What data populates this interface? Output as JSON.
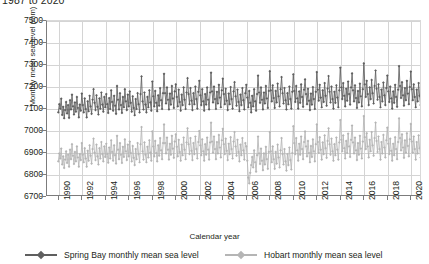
{
  "chart_title": "1987 to 2020",
  "axes": {
    "x_label": "Calendar year",
    "y_label": "Monthly mean sea level (mm)",
    "y_ticks": [
      7500,
      7400,
      7300,
      7200,
      7100,
      7000,
      6900,
      6800,
      6700
    ],
    "x_ticks": [
      1990,
      1992,
      1994,
      1996,
      1998,
      2000,
      2002,
      2004,
      2006,
      2008,
      2010,
      2012,
      2014,
      2016,
      2018,
      2020
    ]
  },
  "legend": {
    "position": "bottom",
    "entries": [
      {
        "label": "Spring Bay monthly mean sea level",
        "color": "#5f5f5f"
      },
      {
        "label": "Hobart monthly mean sea level",
        "color": "#b5b5b5"
      }
    ]
  },
  "chart_data": {
    "type": "line",
    "title": "1987 to 2020",
    "xlabel": "Calendar year",
    "ylabel": "Monthly mean sea level (mm)",
    "xlim": [
      1989.0,
      2020.9
    ],
    "ylim": [
      6700,
      7500
    ],
    "grid": true,
    "x_tick_step": 2,
    "y_tick_step": 100,
    "legend_position": "bottom",
    "marker": "diamond",
    "x_unit": "month",
    "series": [
      {
        "name": "Spring Bay monthly mean sea level",
        "color": "#5f5f5f",
        "x_start": 1989.96,
        "x_step": 0.0833,
        "values": [
          7085,
          7122,
          7101,
          7147,
          7073,
          7110,
          7058,
          7095,
          7132,
          7080,
          7118,
          7060,
          7140,
          7098,
          7165,
          7112,
          7075,
          7130,
          7088,
          7155,
          7105,
          7062,
          7120,
          7092,
          7170,
          7118,
          7085,
          7148,
          7100,
          7062,
          7135,
          7090,
          7160,
          7112,
          7078,
          7142,
          7190,
          7128,
          7095,
          7162,
          7110,
          7075,
          7148,
          7102,
          7175,
          7120,
          7088,
          7155,
          7108,
          7168,
          7122,
          7082,
          7150,
          7100,
          7185,
          7132,
          7092,
          7160,
          7115,
          7078,
          7205,
          7142,
          7098,
          7172,
          7118,
          7082,
          7155,
          7108,
          7190,
          7135,
          7095,
          7165,
          7112,
          7180,
          7128,
          7088,
          7158,
          7105,
          7072,
          7145,
          7100,
          7172,
          7122,
          7085,
          7168,
          7248,
          7135,
          7098,
          7175,
          7120,
          7085,
          7155,
          7108,
          7185,
          7130,
          7092,
          7225,
          7158,
          7112,
          7182,
          7128,
          7090,
          7162,
          7115,
          7195,
          7140,
          7100,
          7172,
          7260,
          7172,
          7125,
          7198,
          7142,
          7098,
          7170,
          7120,
          7205,
          7148,
          7105,
          7180,
          7212,
          7155,
          7112,
          7188,
          7132,
          7092,
          7165,
          7118,
          7198,
          7142,
          7100,
          7175,
          7240,
          7168,
          7122,
          7195,
          7138,
          7095,
          7172,
          7122,
          7202,
          7145,
          7102,
          7178,
          7228,
          7162,
          7118,
          7190,
          7135,
          7092,
          7168,
          7120,
          7198,
          7142,
          7098,
          7175,
          7265,
          7180,
          7130,
          7202,
          7145,
          7100,
          7178,
          7125,
          7210,
          7152,
          7108,
          7185,
          7238,
          7168,
          7122,
          7192,
          7138,
          7095,
          7170,
          7122,
          7200,
          7145,
          7102,
          7180,
          7222,
          7158,
          7115,
          7188,
          7132,
          7090,
          7165,
          7118,
          7195,
          7140,
          7098,
          7172,
          7210,
          7152,
          7108,
          7182,
          7128,
          7085,
          7160,
          7112,
          7190,
          7135,
          7092,
          7168,
          7252,
          7175,
          7128,
          7198,
          7142,
          7098,
          7175,
          7125,
          7205,
          7148,
          7105,
          7182,
          7272,
          7185,
          7135,
          7208,
          7150,
          7105,
          7182,
          7130,
          7215,
          7158,
          7112,
          7190,
          7245,
          7172,
          7125,
          7195,
          7140,
          7098,
          7172,
          7122,
          7202,
          7145,
          7102,
          7178,
          7258,
          7182,
          7132,
          7205,
          7148,
          7102,
          7180,
          7128,
          7212,
          7155,
          7110,
          7188,
          7235,
          7168,
          7122,
          7192,
          7138,
          7095,
          7170,
          7120,
          7200,
          7145,
          7100,
          7178,
          7268,
          7188,
          7138,
          7210,
          7152,
          7108,
          7185,
          7132,
          7218,
          7160,
          7115,
          7192,
          7250,
          7178,
          7130,
          7202,
          7145,
          7102,
          7178,
          7128,
          7208,
          7152,
          7108,
          7185,
          7288,
          7198,
          7145,
          7218,
          7160,
          7112,
          7192,
          7138,
          7225,
          7168,
          7120,
          7198,
          7262,
          7185,
          7135,
          7208,
          7150,
          7105,
          7182,
          7130,
          7215,
          7158,
          7112,
          7190,
          7308,
          7212,
          7155,
          7228,
          7168,
          7118,
          7198,
          7145,
          7232,
          7172,
          7125,
          7205,
          7275,
          7192,
          7142,
          7212,
          7155,
          7108,
          7188,
          7135,
          7220,
          7162,
          7118,
          7195,
          7252,
          7180,
          7132,
          7202,
          7148,
          7102,
          7180,
          7128,
          7210,
          7155,
          7110,
          7188,
          7295,
          7205,
          7150,
          7222,
          7162,
          7115,
          7195,
          7140,
          7228,
          7170,
          7122,
          7200,
          7270,
          7190,
          7140,
          7212,
          7155,
          7108,
          7188,
          7135,
          7218,
          7160,
          7118,
          7198,
          7258,
          7182,
          7135,
          7205,
          7150,
          7105,
          7182,
          7132,
          7212,
          7158,
          7112,
          7192
        ]
      },
      {
        "name": "Hobart monthly mean sea level",
        "color": "#b5b5b5",
        "x_start": 1989.96,
        "x_step": 0.0833,
        "values": [
          6862,
          6898,
          6875,
          6920,
          6848,
          6885,
          6832,
          6870,
          6908,
          6855,
          6892,
          6838,
          6915,
          6872,
          6940,
          6888,
          6850,
          6905,
          6862,
          6930,
          6880,
          6838,
          6895,
          6868,
          6945,
          6892,
          6858,
          6922,
          6875,
          6838,
          6910,
          6865,
          6935,
          6888,
          6852,
          6918,
          6965,
          6902,
          6868,
          6938,
          6885,
          6848,
          6922,
          6875,
          6950,
          6895,
          6862,
          6930,
          6882,
          6942,
          6896,
          6856,
          6925,
          6875,
          6958,
          6905,
          6865,
          6935,
          6890,
          6852,
          6978,
          6915,
          6872,
          6945,
          6892,
          6855,
          6928,
          6882,
          6962,
          6908,
          6868,
          6938,
          6885,
          6952,
          6900,
          6862,
          6932,
          6878,
          6845,
          6918,
          6872,
          6945,
          6895,
          6858,
          6940,
          7018,
          6908,
          6870,
          6948,
          6892,
          6858,
          6928,
          6880,
          6958,
          6902,
          6865,
          6998,
          6930,
          6885,
          6955,
          6900,
          6862,
          6935,
          6888,
          6968,
          6912,
          6872,
          6945,
          7030,
          6945,
          6898,
          6970,
          6915,
          6870,
          6942,
          6892,
          6978,
          6920,
          6878,
          6952,
          6985,
          6928,
          6885,
          6960,
          6905,
          6865,
          6938,
          6890,
          6970,
          6915,
          6872,
          6948,
          7012,
          6940,
          6895,
          6968,
          6910,
          6868,
          6945,
          6895,
          6975,
          6918,
          6875,
          6950,
          7000,
          6935,
          6890,
          6962,
          6908,
          6865,
          6940,
          6892,
          6970,
          6915,
          6870,
          6948,
          7038,
          6952,
          6902,
          6975,
          6918,
          6872,
          6950,
          6898,
          6982,
          6925,
          6880,
          6958,
          7010,
          6940,
          6895,
          6965,
          6910,
          6868,
          6942,
          6895,
          6972,
          6918,
          6875,
          6952,
          6995,
          6930,
          6888,
          6960,
          6905,
          6862,
          6938,
          6890,
          6968,
          6912,
          6870,
          6945,
          6930,
          6865,
          6788,
          6762,
          6810,
          6845,
          6882,
          6835,
          6912,
          6858,
          6815,
          6890,
          6975,
          6898,
          6850,
          6920,
          6865,
          6822,
          6898,
          6848,
          6928,
          6872,
          6828,
          6905,
          6995,
          6908,
          6858,
          6930,
          6872,
          6828,
          6905,
          6852,
          6938,
          6880,
          6835,
          6912,
          6968,
          6895,
          6848,
          6918,
          6862,
          6820,
          6895,
          6845,
          6925,
          6868,
          6825,
          6900,
          7022,
          6945,
          6895,
          6968,
          6912,
          6865,
          6942,
          6892,
          6975,
          6918,
          6872,
          6950,
          6998,
          6930,
          6885,
          6955,
          6900,
          6858,
          6932,
          6882,
          6962,
          6908,
          6862,
          6940,
          7030,
          6950,
          6900,
          6972,
          6915,
          6870,
          6948,
          6895,
          6980,
          6922,
          6878,
          6955,
          7012,
          6940,
          6892,
          6965,
          6908,
          6865,
          6940,
          6890,
          6970,
          6915,
          6870,
          6948,
          7050,
          6960,
          6908,
          6980,
          6922,
          6875,
          6955,
          6900,
          6988,
          6930,
          6882,
          6960,
          7025,
          6948,
          6898,
          6970,
          6912,
          6868,
          6945,
          6892,
          6978,
          6920,
          6875,
          6952,
          7068,
          6972,
          6918,
          6990,
          6930,
          6880,
          6960,
          6908,
          6995,
          6935,
          6888,
          6968,
          7038,
          6955,
          6905,
          6975,
          6918,
          6870,
          6950,
          6898,
          6982,
          6925,
          6880,
          6958,
          7015,
          6942,
          6895,
          6965,
          6910,
          6865,
          6942,
          6890,
          6972,
          6918,
          6872,
          6950,
          7058,
          6968,
          6912,
          6985,
          6925,
          6878,
          6958,
          6902,
          6990,
          6932,
          6885,
          6962,
          7032,
          6952,
          6902,
          6975,
          6918,
          6870,
          6950,
          6898,
          6980,
          6922,
          6880,
          6960,
          7020,
          6945,
          6898,
          6968,
          6912,
          6868,
          6945,
          6895,
          6975,
          6920,
          6875,
          6955
        ]
      }
    ]
  }
}
